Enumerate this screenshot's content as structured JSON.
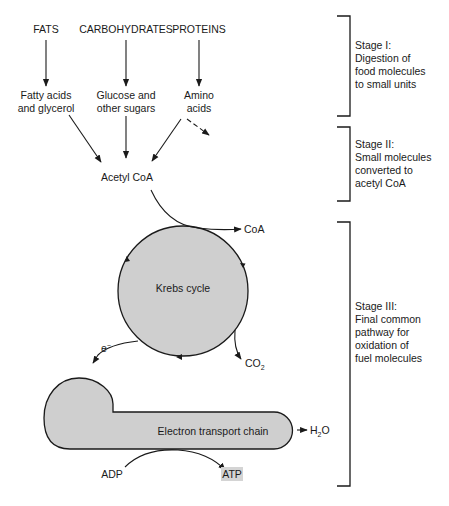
{
  "sources": {
    "fats": "FATS",
    "carbohydrates": "CARBOHYDRATES",
    "proteins": "PROTEINS"
  },
  "small_units": {
    "fats": [
      "Fatty acids",
      "and glycerol"
    ],
    "carbohydrates": [
      "Glucose and",
      "other sugars"
    ],
    "proteins": [
      "Amino",
      "acids"
    ]
  },
  "acetyl_coa": "Acetyl CoA",
  "coa": "CoA",
  "krebs": "Krebs cycle",
  "electron": "e",
  "electron_sup": "−",
  "co2": {
    "main": "CO",
    "sub": "2"
  },
  "etc": "Electron transport chain",
  "h2o": {
    "pre": "H",
    "sub": "2",
    "post": "O"
  },
  "adp": "ADP",
  "atp": "ATP",
  "atp_highlight": "#d4d4d4",
  "shape_fill": "#cfcfcf",
  "stages": [
    {
      "title": "Stage I:",
      "lines": [
        "Digestion of",
        "food molecules",
        "to small units"
      ]
    },
    {
      "title": "Stage II:",
      "lines": [
        "Small molecules",
        "converted to",
        "acetyl CoA"
      ]
    },
    {
      "title": "Stage III:",
      "lines": [
        "Final common",
        "pathway for",
        "oxidation of",
        "fuel molecules"
      ]
    }
  ]
}
